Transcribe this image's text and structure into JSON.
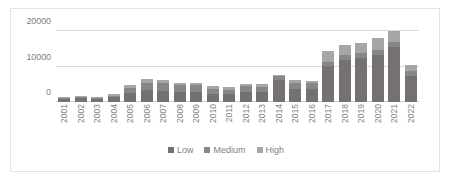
{
  "chart_data": {
    "type": "bar",
    "subtype": "stacked-column",
    "title": "",
    "xlabel": "",
    "ylabel": "",
    "ylim": [
      0,
      20000
    ],
    "ytick_labels": [
      "0",
      "10000",
      "20000"
    ],
    "ytick_values": [
      0,
      10000,
      20000
    ],
    "grid": true,
    "legend_position": "bottom",
    "categories": [
      "2001",
      "2002",
      "2003",
      "2004",
      "2005",
      "2006",
      "2007",
      "2008",
      "2009",
      "2010",
      "2011",
      "2012",
      "2013",
      "2014",
      "2015",
      "2016",
      "2017",
      "2018",
      "2019",
      "2020",
      "2021",
      "2022"
    ],
    "series": [
      {
        "name": "Low",
        "color": "#767171",
        "values": [
          900,
          1000,
          800,
          1300,
          2400,
          3400,
          3200,
          2900,
          2800,
          2300,
          2300,
          2800,
          2700,
          6300,
          3700,
          3600,
          10200,
          11900,
          12500,
          13200,
          15500,
          7400
        ]
      },
      {
        "name": "Medium",
        "color": "#878787",
        "values": [
          250,
          300,
          250,
          400,
          1500,
          2000,
          2100,
          1800,
          1900,
          1500,
          1200,
          1700,
          1600,
          900,
          1800,
          1700,
          1100,
          1300,
          1400,
          1500,
          1500,
          1400
        ]
      },
      {
        "name": "High",
        "color": "#a6a6a6",
        "values": [
          250,
          350,
          250,
          500,
          1000,
          1000,
          1000,
          800,
          800,
          700,
          600,
          700,
          700,
          500,
          700,
          700,
          3000,
          2800,
          2800,
          3200,
          2900,
          1700
        ]
      }
    ],
    "totals": [
      1400,
      1650,
      1300,
      2200,
      4900,
      6400,
      6300,
      5500,
      5500,
      4500,
      4100,
      5200,
      5000,
      7700,
      6200,
      6000,
      14300,
      16000,
      16700,
      17900,
      19900,
      10500
    ]
  },
  "legend": {
    "items": [
      {
        "label": "Low",
        "color": "#767171"
      },
      {
        "label": "Medium",
        "color": "#878787"
      },
      {
        "label": "High",
        "color": "#a6a6a6"
      }
    ]
  }
}
